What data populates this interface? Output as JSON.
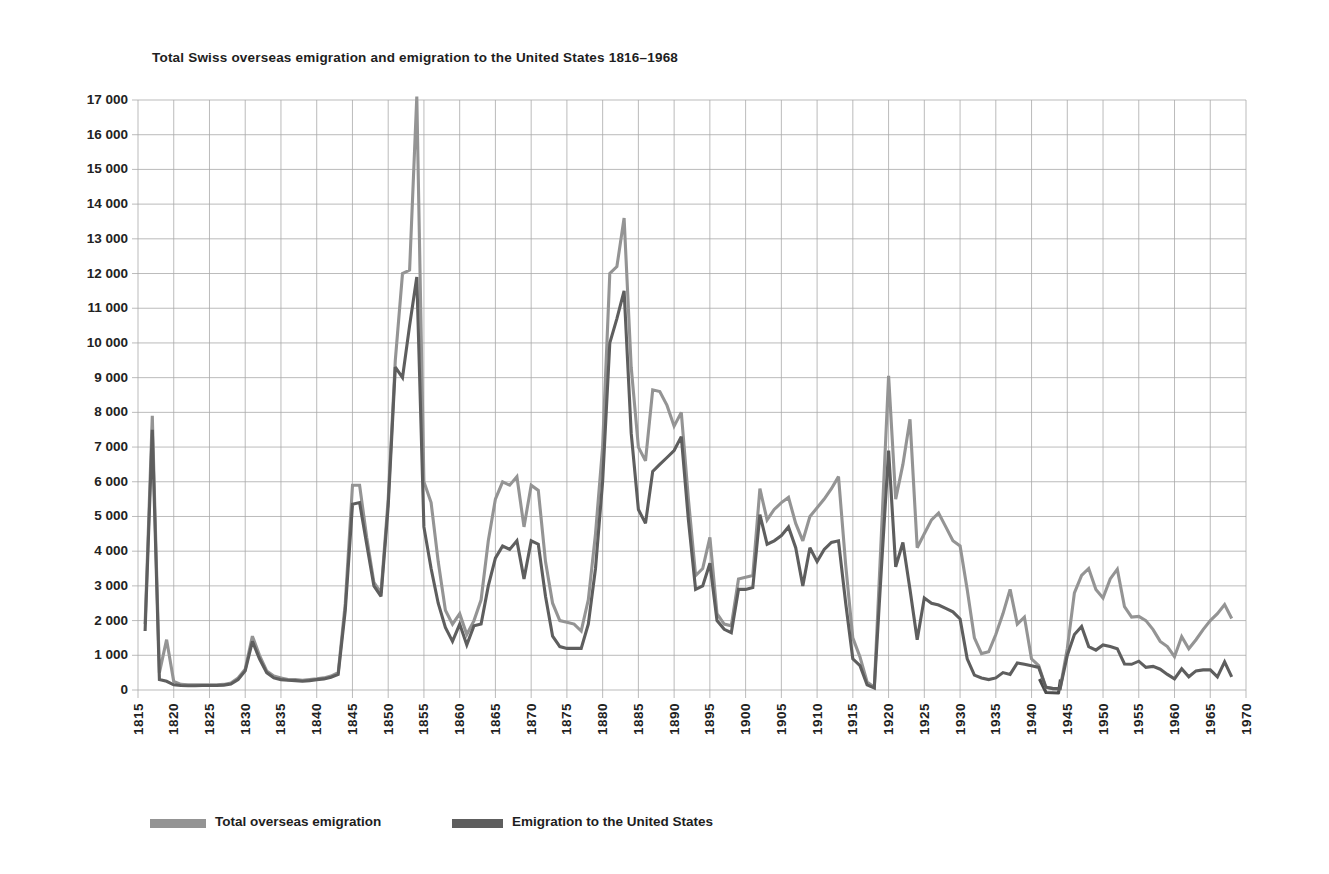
{
  "title": "Total Swiss overseas emigration and emigration to the United States 1816–1968",
  "colors": {
    "total_line": "#949494",
    "us_line": "#5e5e5e",
    "grid": "#a9a9a9",
    "text": "#1e1e1e",
    "artifact": "#4d4d4d"
  },
  "legend": {
    "total_label": "Total overseas emigration",
    "us_label": "Emigration to the United States"
  },
  "y_axis": {
    "min": 0,
    "max": 17000,
    "step": 1000,
    "tick_labels": [
      "0",
      "1 000",
      "2 000",
      "3 000",
      "4 000",
      "5 000",
      "6 000",
      "7 000",
      "8 000",
      "9 000",
      "10 000",
      "11 000",
      "12 000",
      "13 000",
      "14 000",
      "15 000",
      "16 000",
      "17 000"
    ]
  },
  "x_axis": {
    "start": 1815,
    "end": 1970,
    "step": 5,
    "tick_labels": [
      "1815",
      "1820",
      "1825",
      "1830",
      "1835",
      "1840",
      "1845",
      "1850",
      "1855",
      "1860",
      "1865",
      "1870",
      "1875",
      "1880",
      "1885",
      "1890",
      "1895",
      "1900",
      "1905",
      "1910",
      "1915",
      "1920",
      "1925",
      "1930",
      "1935",
      "1940",
      "1945",
      "1950",
      "1955",
      "1960",
      "1965",
      "1970"
    ]
  },
  "chart_data": {
    "type": "line",
    "title": "Total Swiss overseas emigration and emigration to the United States 1816–1968",
    "xlabel": "Year",
    "ylabel": "Emigrants per year",
    "ylim": [
      0,
      17000
    ],
    "grid": true,
    "legend_position": "bottom",
    "year_start": 1816,
    "year_end": 1968,
    "series": [
      {
        "name": "Total overseas emigration",
        "color_key": "total_line",
        "values": [
          1900,
          7900,
          500,
          1450,
          250,
          160,
          150,
          150,
          150,
          150,
          150,
          160,
          200,
          350,
          600,
          1550,
          1000,
          550,
          400,
          350,
          300,
          300,
          280,
          300,
          320,
          350,
          400,
          500,
          2500,
          5900,
          5900,
          4400,
          3100,
          2800,
          5500,
          9500,
          12000,
          12100,
          17100,
          6000,
          5400,
          3700,
          2300,
          1900,
          2200,
          1600,
          2000,
          2600,
          4300,
          5500,
          6000,
          5900,
          6150,
          4700,
          5900,
          5750,
          3700,
          2500,
          2000,
          1950,
          1900,
          1700,
          2600,
          4500,
          7000,
          12000,
          12200,
          13600,
          9300,
          7000,
          6600,
          8650,
          8600,
          8200,
          7600,
          8000,
          5500,
          3300,
          3500,
          4400,
          2200,
          1900,
          1850,
          3200,
          3250,
          3300,
          5800,
          4900,
          5200,
          5400,
          5550,
          4800,
          4300,
          5000,
          5250,
          5500,
          5800,
          6150,
          3600,
          1500,
          950,
          230,
          80,
          4500,
          9050,
          5500,
          6500,
          7800,
          4100,
          4500,
          4900,
          5100,
          4700,
          4300,
          4150,
          2900,
          1500,
          1050,
          1100,
          1600,
          2200,
          2900,
          1900,
          2100,
          900,
          700,
          90,
          40,
          40,
          1200,
          2800,
          3300,
          3500,
          2900,
          2650,
          3200,
          3480,
          2400,
          2100,
          2120,
          2000,
          1740,
          1400,
          1250,
          960,
          1540,
          1190,
          1450,
          1740,
          2000,
          2200,
          2460,
          2060
        ]
      },
      {
        "name": "Emigration to the United States",
        "color_key": "us_line",
        "values": [
          1700,
          7500,
          300,
          250,
          150,
          130,
          120,
          120,
          130,
          130,
          130,
          140,
          170,
          300,
          550,
          1400,
          900,
          500,
          350,
          300,
          280,
          270,
          250,
          270,
          300,
          320,
          370,
          450,
          2300,
          5350,
          5400,
          4200,
          3000,
          2700,
          5300,
          9300,
          9000,
          10500,
          11900,
          4700,
          3500,
          2500,
          1800,
          1400,
          1900,
          1300,
          1850,
          1900,
          3000,
          3800,
          4150,
          4050,
          4300,
          3200,
          4300,
          4200,
          2700,
          1550,
          1250,
          1200,
          1200,
          1200,
          1900,
          3500,
          6000,
          10000,
          10700,
          11500,
          7400,
          5200,
          4800,
          6300,
          6500,
          6700,
          6900,
          7300,
          4900,
          2900,
          3000,
          3650,
          2000,
          1750,
          1650,
          2900,
          2900,
          2950,
          5050,
          4200,
          4300,
          4450,
          4700,
          4100,
          3000,
          4100,
          3700,
          4050,
          4250,
          4300,
          2500,
          900,
          700,
          150,
          60,
          3500,
          6900,
          3550,
          4250,
          2900,
          1450,
          2650,
          2500,
          2450,
          2350,
          2250,
          2050,
          900,
          430,
          350,
          300,
          350,
          500,
          450,
          780,
          740,
          700,
          650,
          80,
          40,
          40,
          1000,
          1600,
          1830,
          1250,
          1150,
          1300,
          1250,
          1190,
          750,
          740,
          830,
          650,
          680,
          600,
          450,
          320,
          610,
          380,
          550,
          580,
          580,
          380,
          810,
          380
        ]
      }
    ]
  }
}
